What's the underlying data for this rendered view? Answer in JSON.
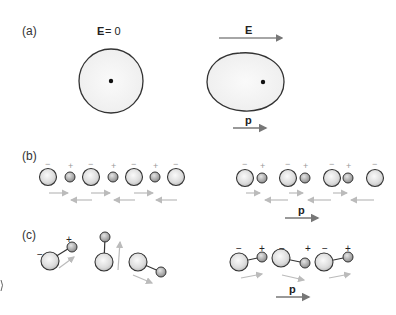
{
  "panels": {
    "a": {
      "label": "(a)",
      "left": {
        "field_symbol": "E",
        "field_eq": " = 0",
        "description": "spherical electron cloud, no polarization"
      },
      "right": {
        "field_symbol": "E",
        "dipole_symbol": "p",
        "description": "distorted electron cloud with dipole moment"
      }
    },
    "b": {
      "label": "(b)",
      "charges": {
        "negative": "−",
        "positive": "+"
      },
      "dipole_symbol": "p",
      "left_description": "ionic chain, dipoles cancel",
      "right_description": "displaced ions, net dipole"
    },
    "c": {
      "label": "(c)",
      "charges": {
        "negative": "−",
        "positive": "+"
      },
      "dipole_symbol": "p",
      "left_description": "randomly oriented polar molecules",
      "right_description": "aligned polar molecules, net dipole"
    }
  },
  "colors": {
    "outline": "#333333",
    "arrow_dark": "#777777",
    "arrow_light": "#bbbbbb",
    "sphere_fill": "#e8e8e8",
    "small_sphere_fill": "#b5b5b5"
  }
}
